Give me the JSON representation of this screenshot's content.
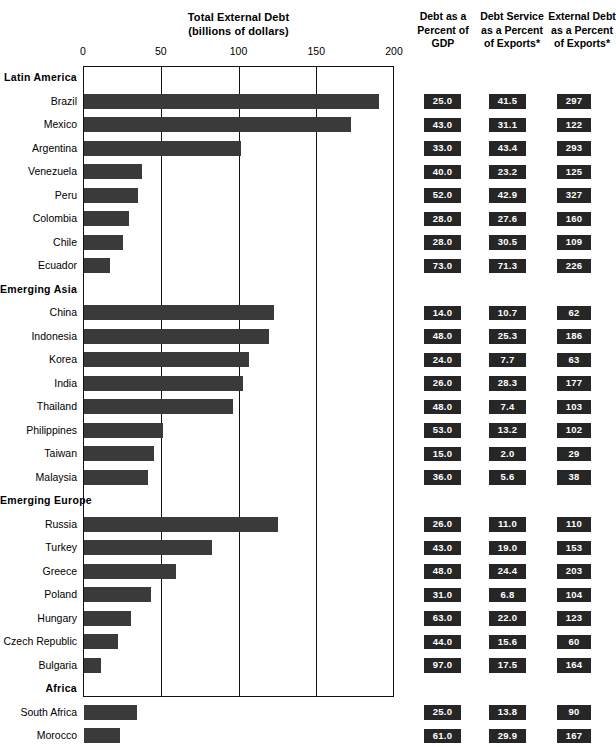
{
  "chart": {
    "title_line1": "Total External Debt",
    "title_line2": "(billions of dollars)",
    "columns": {
      "col1": {
        "l1": "Debt as a",
        "l2": "Percent of",
        "l3": "GDP"
      },
      "col2": {
        "l1": "Debt Service",
        "l2": "as a Percent",
        "l3": "of Exports*"
      },
      "col3": {
        "l1": "External Debt",
        "l2": "as a Percent",
        "l3": "of Exports*"
      }
    },
    "colors": {
      "bar_fill": "#3a3a3a",
      "value_box": "#262626",
      "value_text": "#ffffff",
      "frame": "#111111"
    }
  },
  "chart_data": {
    "type": "bar",
    "orientation": "horizontal",
    "title": "Total External Debt (billions of dollars)",
    "xlabel": "",
    "ylabel": "",
    "xlim": [
      0,
      200
    ],
    "xticks": [
      0,
      50,
      100,
      150,
      200
    ],
    "xtick_labels": [
      "0",
      "50",
      "100",
      "150",
      "200"
    ],
    "grid": true,
    "legend": null,
    "series_names": [
      "Total External Debt (billions of dollars)",
      "Debt as a Percent of GDP",
      "Debt Service as a Percent of Exports*",
      "External Debt as a Percent of Exports*"
    ],
    "rows": [
      {
        "label": "Latin America",
        "group": true
      },
      {
        "label": "Brazil",
        "group": false,
        "debt": 190,
        "gdp_pct": "25.0",
        "service_pct": "41.5",
        "export_pct": "297"
      },
      {
        "label": "Mexico",
        "group": false,
        "debt": 172,
        "gdp_pct": "43.0",
        "service_pct": "31.1",
        "export_pct": "122"
      },
      {
        "label": "Argentina",
        "group": false,
        "debt": 101,
        "gdp_pct": "33.0",
        "service_pct": "43.4",
        "export_pct": "293"
      },
      {
        "label": "Venezuela",
        "group": false,
        "debt": 37,
        "gdp_pct": "40.0",
        "service_pct": "23.2",
        "export_pct": "125"
      },
      {
        "label": "Peru",
        "group": false,
        "debt": 35,
        "gdp_pct": "52.0",
        "service_pct": "42.9",
        "export_pct": "327"
      },
      {
        "label": "Colombia",
        "group": false,
        "debt": 29,
        "gdp_pct": "28.0",
        "service_pct": "27.6",
        "export_pct": "160"
      },
      {
        "label": "Chile",
        "group": false,
        "debt": 25,
        "gdp_pct": "28.0",
        "service_pct": "30.5",
        "export_pct": "109"
      },
      {
        "label": "Ecuador",
        "group": false,
        "debt": 17,
        "gdp_pct": "73.0",
        "service_pct": "71.3",
        "export_pct": "226"
      },
      {
        "label": "Emerging Asia",
        "group": true
      },
      {
        "label": "China",
        "group": false,
        "debt": 122,
        "gdp_pct": "14.0",
        "service_pct": "10.7",
        "export_pct": "62"
      },
      {
        "label": "Indonesia",
        "group": false,
        "debt": 119,
        "gdp_pct": "48.0",
        "service_pct": "25.3",
        "export_pct": "186"
      },
      {
        "label": "Korea",
        "group": false,
        "debt": 106,
        "gdp_pct": "24.0",
        "service_pct": "7.7",
        "export_pct": "63"
      },
      {
        "label": "India",
        "group": false,
        "debt": 102,
        "gdp_pct": "26.0",
        "service_pct": "28.3",
        "export_pct": "177"
      },
      {
        "label": "Thailand",
        "group": false,
        "debt": 96,
        "gdp_pct": "48.0",
        "service_pct": "7.4",
        "export_pct": "103"
      },
      {
        "label": "Philippines",
        "group": false,
        "debt": 51,
        "gdp_pct": "53.0",
        "service_pct": "13.2",
        "export_pct": "102"
      },
      {
        "label": "Taiwan",
        "group": false,
        "debt": 45,
        "gdp_pct": "15.0",
        "service_pct": "2.0",
        "export_pct": "29"
      },
      {
        "label": "Malaysia",
        "group": false,
        "debt": 41,
        "gdp_pct": "36.0",
        "service_pct": "5.6",
        "export_pct": "38"
      },
      {
        "label": "Emerging  Europe",
        "group": true
      },
      {
        "label": "Russia",
        "group": false,
        "debt": 125,
        "gdp_pct": "26.0",
        "service_pct": "11.0",
        "export_pct": "110"
      },
      {
        "label": "Turkey",
        "group": false,
        "debt": 82,
        "gdp_pct": "43.0",
        "service_pct": "19.0",
        "export_pct": "153"
      },
      {
        "label": "Greece",
        "group": false,
        "debt": 59,
        "gdp_pct": "48.0",
        "service_pct": "24.4",
        "export_pct": "203"
      },
      {
        "label": "Poland",
        "group": false,
        "debt": 43,
        "gdp_pct": "31.0",
        "service_pct": "6.8",
        "export_pct": "104"
      },
      {
        "label": "Hungary",
        "group": false,
        "debt": 30,
        "gdp_pct": "63.0",
        "service_pct": "22.0",
        "export_pct": "123"
      },
      {
        "label": "Czech Republic",
        "group": false,
        "debt": 22,
        "gdp_pct": "44.0",
        "service_pct": "15.6",
        "export_pct": "60"
      },
      {
        "label": "Bulgaria",
        "group": false,
        "debt": 11,
        "gdp_pct": "97.0",
        "service_pct": "17.5",
        "export_pct": "164"
      },
      {
        "label": "Africa",
        "group": true
      },
      {
        "label": "South Africa",
        "group": false,
        "debt": 34,
        "gdp_pct": "25.0",
        "service_pct": "13.8",
        "export_pct": "90"
      },
      {
        "label": "Morocco",
        "group": false,
        "debt": 23,
        "gdp_pct": "61.0",
        "service_pct": "29.9",
        "export_pct": "167"
      }
    ]
  }
}
